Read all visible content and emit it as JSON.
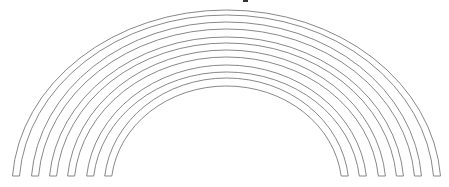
{
  "figure": {
    "stroke_color": "#7a7a7a",
    "background": "#ffffff",
    "center": {
      "x": 226.5,
      "y": 188
    },
    "base_y": 176,
    "bands": [
      {
        "outer": {
          "rx": 214.5,
          "ry": 178
        },
        "inner": {
          "rx": 207.5,
          "ry": 173
        }
      },
      {
        "outer": {
          "rx": 195.5,
          "ry": 166
        },
        "inner": {
          "rx": 188.5,
          "ry": 159
        }
      },
      {
        "outer": {
          "rx": 177.5,
          "ry": 151
        },
        "inner": {
          "rx": 170.5,
          "ry": 145
        }
      },
      {
        "outer": {
          "rx": 159.5,
          "ry": 138
        },
        "inner": {
          "rx": 152.5,
          "ry": 131
        }
      },
      {
        "outer": {
          "rx": 140.5,
          "ry": 123
        },
        "inner": {
          "rx": 133.5,
          "ry": 116
        }
      },
      {
        "outer": {
          "rx": 122.5,
          "ry": 110
        },
        "inner": {
          "rx": 115.5,
          "ry": 102
        }
      }
    ]
  },
  "top_mark": {
    "x": 243,
    "width": 5
  }
}
